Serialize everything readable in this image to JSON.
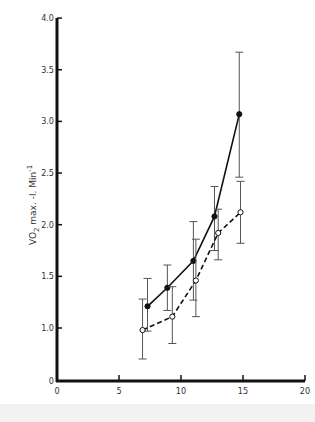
{
  "chart_data": {
    "type": "line",
    "title": "",
    "xlabel": "AGE - Years",
    "ylabel": "VO2 max. -l. Min-1",
    "ylabel_parts": {
      "main": "VO",
      "sub": "2",
      "rest": " max. -l. Min",
      "sup": "-1"
    },
    "xlim": [
      0,
      20
    ],
    "ylim": [
      0,
      4.0
    ],
    "x_ticks": [
      0,
      5,
      10,
      15,
      20
    ],
    "y_ticks": [
      0,
      1.0,
      1.5,
      2.0,
      2.5,
      3.0,
      3.5,
      4.0
    ],
    "y_tick_labels": [
      "0",
      "1.0",
      "1.5",
      "2.0",
      "2.5",
      "3.0",
      "3.5",
      "4.0"
    ],
    "y_axis_break": "between 0 and 1.0",
    "grid": false,
    "legend": "none",
    "series": [
      {
        "name": "filled circles (solid line)",
        "marker": "filled-circle",
        "line_style": "solid",
        "x": [
          7.3,
          8.9,
          11.0,
          12.7,
          14.7
        ],
        "y": [
          1.21,
          1.39,
          1.65,
          2.08,
          3.07
        ],
        "error_low": [
          0.97,
          1.17,
          1.27,
          1.75,
          2.46
        ],
        "error_high": [
          1.48,
          1.61,
          2.03,
          2.37,
          3.67
        ]
      },
      {
        "name": "open circles (dashed line)",
        "marker": "open-circle",
        "line_style": "dashed",
        "x": [
          6.9,
          9.3,
          11.2,
          13.0,
          14.8
        ],
        "y": [
          0.98,
          1.11,
          1.46,
          1.92,
          2.12
        ],
        "error_low": [
          0.7,
          0.85,
          1.11,
          1.66,
          1.82
        ],
        "error_high": [
          1.28,
          1.4,
          1.86,
          2.15,
          2.42
        ]
      }
    ]
  }
}
